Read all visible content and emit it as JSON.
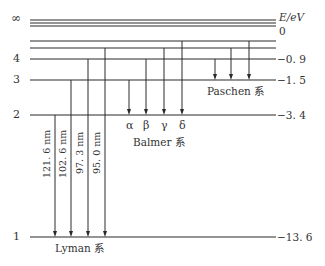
{
  "diagram": {
    "axis_label": "E/eV",
    "levels": [
      {
        "n": "∞",
        "energy": "0",
        "y": 23
      },
      {
        "n": "6",
        "energy": "",
        "y": 41
      },
      {
        "n": "5",
        "energy": "",
        "y": 48
      },
      {
        "n": "4",
        "energy": "−0. 9",
        "y": 59
      },
      {
        "n": "3",
        "energy": "−1. 5",
        "y": 80
      },
      {
        "n": "2",
        "energy": "−3. 4",
        "y": 115
      },
      {
        "n": "1",
        "energy": "−13. 6",
        "y": 237
      }
    ],
    "level_labels": {
      "inf": "∞",
      "n4": "4",
      "n3": "3",
      "n2": "2",
      "n1": "1"
    },
    "energy_labels": {
      "inf": "0",
      "n4": "−0. 9",
      "n3": "−1. 5",
      "n2": "−3. 4",
      "n1": "−13. 6"
    },
    "series": {
      "lyman": {
        "name": "Lyman 系",
        "transitions": [
          {
            "from": 2,
            "to": 1,
            "wavelength": "121. 6 nm"
          },
          {
            "from": 3,
            "to": 1,
            "wavelength": "102. 6 nm"
          },
          {
            "from": 4,
            "to": 1,
            "wavelength": "97. 3 nm"
          },
          {
            "from": 5,
            "to": 1,
            "wavelength": "95. 0 nm"
          }
        ]
      },
      "balmer": {
        "name": "Balmer 系",
        "transitions": [
          {
            "from": 3,
            "to": 2,
            "label": "α"
          },
          {
            "from": 4,
            "to": 2,
            "label": "β"
          },
          {
            "from": 5,
            "to": 2,
            "label": "γ"
          },
          {
            "from": 6,
            "to": 2,
            "label": "δ"
          }
        ]
      },
      "paschen": {
        "name": "Paschen 系",
        "transitions": [
          {
            "from": 4,
            "to": 3
          },
          {
            "from": 5,
            "to": 3
          },
          {
            "from": 6,
            "to": 3
          }
        ]
      }
    },
    "colors": {
      "line": "#2a2a2a",
      "background": "#ffffff"
    }
  }
}
